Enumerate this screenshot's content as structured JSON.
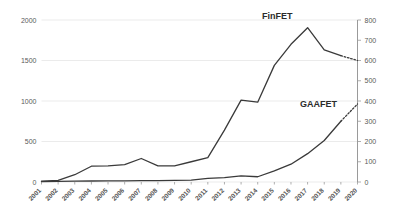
{
  "chart_data": {
    "type": "line",
    "title": "",
    "xlabel": "",
    "ylabel": "",
    "grid": true,
    "legend_position": "inline-annotation",
    "categories": [
      "2001",
      "2002",
      "2003",
      "2004",
      "2005",
      "2006",
      "2007",
      "2008",
      "2009",
      "2010",
      "2011",
      "2012",
      "2013",
      "2014",
      "2015",
      "2016",
      "2017",
      "2018",
      "2019",
      "2020"
    ],
    "axes": {
      "left": {
        "label": "",
        "ylim": [
          0,
          2000
        ],
        "ticks": [
          0,
          500,
          1000,
          1500,
          2000
        ],
        "tick_labels": [
          "0",
          "500",
          "1000",
          "1500",
          "2000"
        ]
      },
      "right": {
        "label": "",
        "ylim": [
          0,
          800
        ],
        "ticks": [
          0,
          100,
          200,
          300,
          400,
          500,
          600,
          700,
          800
        ],
        "tick_labels": [
          "0",
          "100",
          "200",
          "300",
          "400",
          "500",
          "600",
          "700",
          "800"
        ]
      }
    },
    "series": [
      {
        "name": "FinFET",
        "axis": "left",
        "label": "FinFET",
        "values": [
          10,
          20,
          90,
          195,
          200,
          215,
          290,
          200,
          200,
          250,
          300,
          640,
          1010,
          985,
          1440,
          1700,
          1905,
          1630,
          1560,
          1500
        ],
        "solid_through": "2019",
        "dashed_from": "2019",
        "dashed_note": "projection"
      },
      {
        "name": "GAAFET",
        "axis": "right",
        "label": "GAAFET",
        "values": [
          2,
          3,
          4,
          5,
          6,
          6,
          7,
          7,
          8,
          9,
          18,
          22,
          30,
          26,
          55,
          88,
          140,
          205,
          300,
          385
        ],
        "solid_through": "2019",
        "dashed_from": "2019",
        "dashed_note": "projection"
      }
    ],
    "annotations": [
      {
        "text": "FinFET",
        "series": "FinFET"
      },
      {
        "text": "GAAFET",
        "series": "GAAFET"
      }
    ]
  }
}
